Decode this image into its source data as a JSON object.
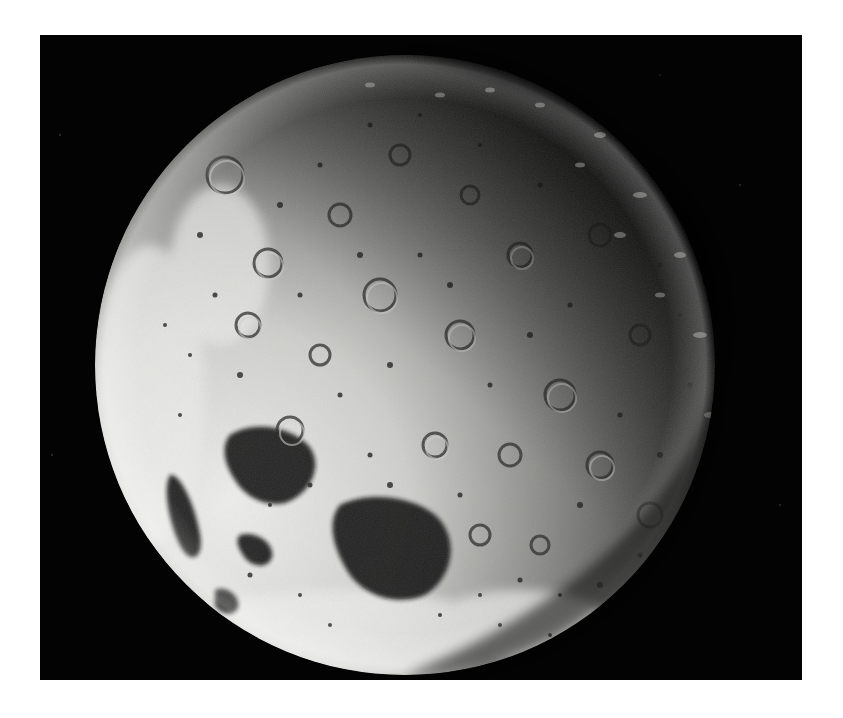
{
  "image": {
    "subject": "Moon",
    "description": "Black-and-white photograph of the lunar far side, partially illuminated, heavily cratered surface with dark maria at lower left",
    "colors": {
      "page_background": "#ffffff",
      "frame_background": "#030303",
      "highland_bright": "#e8e8e6",
      "surface_mid": "#8a8a88",
      "mare_dark": "#1a1a1a",
      "shadow": "#050505"
    }
  }
}
